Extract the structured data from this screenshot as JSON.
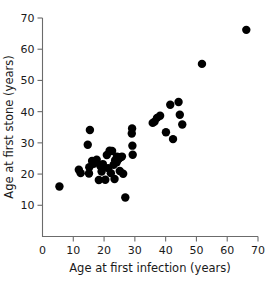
{
  "chart_data": {
    "type": "scatter",
    "title": "",
    "xlabel": "Age at first infection (years)",
    "ylabel": "Age at first stone (years)",
    "xlim": [
      0,
      70
    ],
    "ylim": [
      0,
      70
    ],
    "xticks": [
      0,
      10,
      20,
      30,
      40,
      50,
      60,
      70
    ],
    "yticks": [
      10,
      20,
      30,
      40,
      50,
      60,
      70
    ],
    "xtick_labels": [
      "0",
      "10",
      "20",
      "30",
      "40",
      "50",
      "60",
      "70"
    ],
    "ytick_labels": [
      "10",
      "20",
      "30",
      "40",
      "50",
      "60",
      "70"
    ],
    "grid": false,
    "legend": null,
    "marker": "filled-circle",
    "marker_color": "#000000",
    "marker_size": 4.2,
    "n_points": 47,
    "points": [
      {
        "x": 5.5,
        "y": 16.0
      },
      {
        "x": 11.8,
        "y": 21.4
      },
      {
        "x": 12.4,
        "y": 20.3
      },
      {
        "x": 14.7,
        "y": 29.4
      },
      {
        "x": 15.4,
        "y": 34.1
      },
      {
        "x": 15.2,
        "y": 22.2
      },
      {
        "x": 15.1,
        "y": 20.2
      },
      {
        "x": 16.6,
        "y": 23.3
      },
      {
        "x": 17.6,
        "y": 24.6
      },
      {
        "x": 18.3,
        "y": 18.1
      },
      {
        "x": 18.8,
        "y": 22.6
      },
      {
        "x": 19.6,
        "y": 23.2
      },
      {
        "x": 20.4,
        "y": 18.2
      },
      {
        "x": 20.9,
        "y": 26.1
      },
      {
        "x": 21.3,
        "y": 21.9
      },
      {
        "x": 21.8,
        "y": 27.5
      },
      {
        "x": 22.6,
        "y": 27.4
      },
      {
        "x": 22.2,
        "y": 20.3
      },
      {
        "x": 23.1,
        "y": 23.0
      },
      {
        "x": 23.6,
        "y": 24.4
      },
      {
        "x": 23.4,
        "y": 18.4
      },
      {
        "x": 24.2,
        "y": 25.6
      },
      {
        "x": 24.1,
        "y": 23.8
      },
      {
        "x": 24.8,
        "y": 24.9
      },
      {
        "x": 25.3,
        "y": 25.4
      },
      {
        "x": 25.1,
        "y": 21.0
      },
      {
        "x": 25.8,
        "y": 25.6
      },
      {
        "x": 26.2,
        "y": 20.1
      },
      {
        "x": 26.9,
        "y": 12.5
      },
      {
        "x": 29.1,
        "y": 34.6
      },
      {
        "x": 29.0,
        "y": 33.0
      },
      {
        "x": 29.2,
        "y": 29.1
      },
      {
        "x": 29.3,
        "y": 26.2
      },
      {
        "x": 35.8,
        "y": 36.4
      },
      {
        "x": 36.4,
        "y": 36.8
      },
      {
        "x": 37.2,
        "y": 38.0
      },
      {
        "x": 38.2,
        "y": 38.7
      },
      {
        "x": 40.1,
        "y": 33.4
      },
      {
        "x": 41.5,
        "y": 42.2
      },
      {
        "x": 42.4,
        "y": 31.2
      },
      {
        "x": 44.2,
        "y": 43.1
      },
      {
        "x": 44.6,
        "y": 39.0
      },
      {
        "x": 45.4,
        "y": 35.9
      },
      {
        "x": 51.8,
        "y": 55.3
      },
      {
        "x": 66.2,
        "y": 66.2
      },
      {
        "x": 16.1,
        "y": 24.2
      },
      {
        "x": 19.2,
        "y": 20.8
      }
    ]
  },
  "axes": {
    "x_title": "Age at first infection (years)",
    "y_title": "Age at first stone (years)",
    "axis_color": "#6b6b6b"
  }
}
